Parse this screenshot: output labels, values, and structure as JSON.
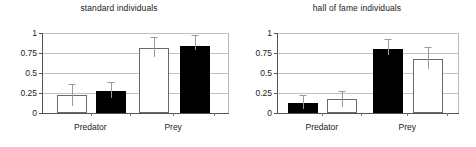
{
  "figure": {
    "panels": [
      {
        "id": "standard",
        "title": "standard individuals"
      },
      {
        "id": "hall-of-fame",
        "title": "hall of fame individuals"
      }
    ]
  },
  "axis": {
    "yticks": [
      "0",
      "0.25",
      "0.5",
      "0.75",
      "1"
    ],
    "ytick_values": [
      0,
      0.25,
      0.5,
      0.75,
      1
    ],
    "xticks": [
      "Predator",
      "Prey"
    ]
  },
  "chart_data": [
    {
      "type": "bar",
      "title": "standard individuals",
      "xlabel": "",
      "ylabel": "",
      "ylim": [
        0,
        1
      ],
      "yticks": [
        0,
        0.25,
        0.5,
        0.75,
        1
      ],
      "ytick_labels": [
        "0",
        "0.25",
        "0.5",
        "0.75",
        "1"
      ],
      "categories": [
        "Predator",
        "Prey"
      ],
      "grid": true,
      "legend": "none",
      "series": [
        {
          "name": "open",
          "fill": "#ffffff",
          "values": [
            0.23,
            0.81
          ],
          "errors_upper": [
            0.36,
            0.95
          ],
          "errors_lower": [
            0.09,
            0.7
          ]
        },
        {
          "name": "filled",
          "fill": "#000000",
          "values": [
            0.28,
            0.84
          ],
          "errors_upper": [
            0.39,
            0.97
          ],
          "errors_lower": [
            0.19,
            0.79
          ]
        }
      ]
    },
    {
      "type": "bar",
      "title": "hall of fame individuals",
      "xlabel": "",
      "ylabel": "",
      "ylim": [
        0,
        1
      ],
      "yticks": [
        0,
        0.25,
        0.5,
        0.75,
        1
      ],
      "ytick_labels": [
        "0",
        "0.25",
        "0.5",
        "0.75",
        "1"
      ],
      "categories": [
        "Predator",
        "Prey"
      ],
      "grid": true,
      "legend": "none",
      "series": [
        {
          "name": "filled",
          "fill": "#000000",
          "values": [
            0.13,
            0.8
          ],
          "errors_upper": [
            0.22,
            0.93
          ],
          "errors_lower": [
            0.05,
            0.72
          ]
        },
        {
          "name": "open",
          "fill": "#ffffff",
          "values": [
            0.18,
            0.68
          ],
          "errors_upper": [
            0.27,
            0.82
          ],
          "errors_lower": [
            0.07,
            0.55
          ]
        }
      ]
    }
  ],
  "colors": {
    "filled_bar": "#000000",
    "open_bar": "#ffffff",
    "bar_outline": "#6a6a6a",
    "axis": "#555555",
    "gridline": "#c2c2c2",
    "error_bar": "#9a9a9a",
    "text": "#1a1a1a",
    "background": "#ffffff"
  }
}
